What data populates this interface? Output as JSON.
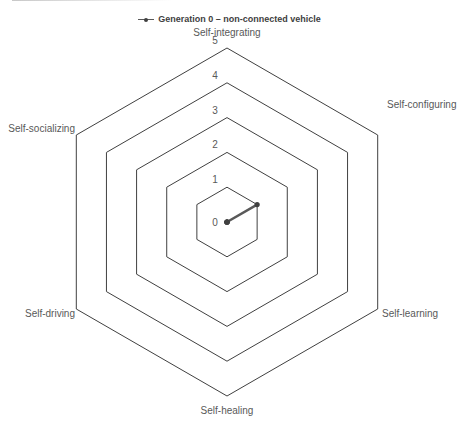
{
  "chart_data": {
    "type": "radar",
    "title": "",
    "legend": {
      "position": "top",
      "entries": [
        "Generation 0 – non-connected vehicle"
      ]
    },
    "categories": [
      "Self-integrating",
      "Self-configuring",
      "Self-learning",
      "Self-healing",
      "Self-driving",
      "Self-socializing"
    ],
    "series": [
      {
        "name": "Generation 0 – non-connected vehicle",
        "values": [
          0,
          1,
          0,
          0,
          0,
          0
        ],
        "color": "#595959"
      }
    ],
    "radial_ticks": [
      "0",
      "1",
      "2",
      "3",
      "4",
      "5"
    ],
    "rlim": [
      0,
      5
    ],
    "grid": true,
    "grid_shape": "hexagon"
  },
  "legend_label": "Generation 0 – non-connected vehicle"
}
